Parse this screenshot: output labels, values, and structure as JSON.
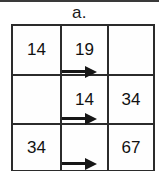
{
  "figure": {
    "label": "a.",
    "type": "lattice-grid",
    "rows": 3,
    "cols": 3,
    "grid": [
      [
        "14",
        "19",
        ""
      ],
      [
        "",
        "14",
        "34"
      ],
      [
        "34",
        "",
        "67"
      ]
    ],
    "arrows": [
      {
        "name": "row-1-arrow",
        "direction": "right"
      },
      {
        "name": "row-2-arrow",
        "direction": "right"
      },
      {
        "name": "row-3-arrow",
        "direction": "right"
      }
    ],
    "colors": {
      "background": "#ffffff",
      "grid_line": "#2b2b2b",
      "text": "#111111",
      "arrow": "#161616"
    }
  }
}
